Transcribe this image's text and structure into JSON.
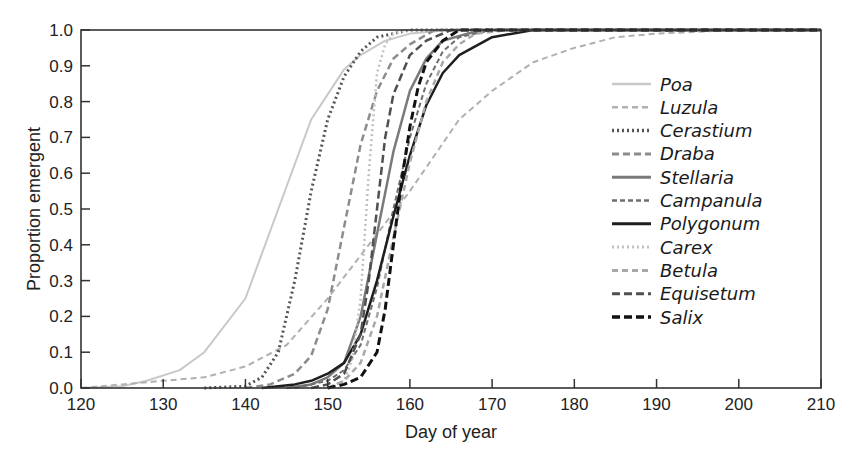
{
  "chart_data": {
    "type": "line",
    "title": "",
    "xlabel": "Day of year",
    "ylabel": "Proportion emergent",
    "xlim": [
      120,
      210
    ],
    "ylim": [
      0.0,
      1.0
    ],
    "x_ticks": [
      120,
      130,
      140,
      150,
      160,
      170,
      180,
      190,
      200,
      210
    ],
    "x_tick_labels": [
      "120",
      "130",
      "140",
      "150",
      "160",
      "170",
      "180",
      "190",
      "200",
      "210"
    ],
    "y_ticks": [
      0.0,
      0.1,
      0.2,
      0.3,
      0.4,
      0.5,
      0.6,
      0.7,
      0.8,
      0.9,
      1.0
    ],
    "y_tick_labels": [
      "0.0",
      "0.1",
      "0.2",
      "0.3",
      "0.4",
      "0.5",
      "0.6",
      "0.7",
      "0.8",
      "0.9",
      "1.0"
    ],
    "grid": false,
    "legend_position": "right, inside plot",
    "series": [
      {
        "name": "Poa",
        "color": "#c8c8c8",
        "dash": "solid",
        "width": 2,
        "x": [
          120,
          125,
          128,
          132,
          135,
          140,
          144,
          148,
          152,
          154,
          157,
          160,
          165,
          210
        ],
        "y": [
          0.0,
          0.005,
          0.02,
          0.05,
          0.1,
          0.25,
          0.5,
          0.75,
          0.89,
          0.93,
          0.97,
          0.99,
          1.0,
          1.0
        ]
      },
      {
        "name": "Luzula",
        "color": "#b0b0b0",
        "dash": "6,4",
        "width": 2,
        "x": [
          120,
          125,
          130,
          135,
          140,
          145,
          150,
          155,
          160,
          163,
          166,
          170,
          175,
          180,
          185,
          190,
          200,
          210
        ],
        "y": [
          0.0,
          0.01,
          0.02,
          0.03,
          0.06,
          0.12,
          0.25,
          0.4,
          0.55,
          0.65,
          0.75,
          0.83,
          0.91,
          0.95,
          0.98,
          0.99,
          1.0,
          1.0
        ]
      },
      {
        "name": "Cerastium",
        "color": "#555555",
        "dash": "2,3",
        "width": 3,
        "x": [
          135,
          140,
          142,
          144,
          146,
          148,
          150,
          152,
          154,
          156,
          160,
          210
        ],
        "y": [
          0.0,
          0.005,
          0.03,
          0.1,
          0.3,
          0.55,
          0.75,
          0.87,
          0.94,
          0.98,
          1.0,
          1.0
        ]
      },
      {
        "name": "Draba",
        "color": "#8c8c8c",
        "dash": "7,4",
        "width": 2.5,
        "x": [
          140,
          143,
          146,
          148,
          150,
          152,
          154,
          156,
          158,
          160,
          163,
          210
        ],
        "y": [
          0.0,
          0.01,
          0.04,
          0.09,
          0.22,
          0.45,
          0.68,
          0.83,
          0.92,
          0.96,
          1.0,
          1.0
        ]
      },
      {
        "name": "Stellaria",
        "color": "#7a7a7a",
        "dash": "solid",
        "width": 2.5,
        "x": [
          145,
          148,
          150,
          152,
          154,
          156,
          158,
          160,
          162,
          164,
          167,
          170,
          210
        ],
        "y": [
          0.0,
          0.01,
          0.03,
          0.07,
          0.2,
          0.43,
          0.66,
          0.83,
          0.92,
          0.97,
          0.99,
          1.0,
          1.0
        ]
      },
      {
        "name": "Campanula",
        "color": "#6e6e6e",
        "dash": "5,3",
        "width": 2,
        "x": [
          146,
          150,
          152,
          154,
          156,
          158,
          160,
          162,
          164,
          166,
          170,
          210
        ],
        "y": [
          0.0,
          0.02,
          0.05,
          0.12,
          0.28,
          0.5,
          0.7,
          0.85,
          0.94,
          0.98,
          1.0,
          1.0
        ]
      },
      {
        "name": "Polygonum",
        "color": "#1e1e1e",
        "dash": "solid",
        "width": 2.5,
        "x": [
          142,
          146,
          148,
          150,
          152,
          154,
          156,
          158,
          160,
          162,
          164,
          166,
          170,
          175,
          210
        ],
        "y": [
          0.0,
          0.01,
          0.02,
          0.04,
          0.07,
          0.15,
          0.3,
          0.48,
          0.65,
          0.79,
          0.88,
          0.93,
          0.98,
          1.0,
          1.0
        ]
      },
      {
        "name": "Carex",
        "color": "#c0c0c0",
        "dash": "2,3",
        "width": 2.5,
        "x": [
          150,
          152,
          153,
          154,
          155,
          156,
          157,
          158,
          160,
          210
        ],
        "y": [
          0.0,
          0.02,
          0.08,
          0.25,
          0.6,
          0.88,
          0.96,
          0.99,
          1.0,
          1.0
        ]
      },
      {
        "name": "Betula",
        "color": "#a8a8a8",
        "dash": "6,4",
        "width": 2.5,
        "x": [
          150,
          152,
          154,
          156,
          158,
          160,
          162,
          164,
          166,
          168,
          172,
          210
        ],
        "y": [
          0.0,
          0.02,
          0.07,
          0.2,
          0.42,
          0.63,
          0.8,
          0.91,
          0.96,
          0.99,
          1.0,
          1.0
        ]
      },
      {
        "name": "Equisetum",
        "color": "#505050",
        "dash": "8,4",
        "width": 2.5,
        "x": [
          148,
          150,
          152,
          154,
          155,
          156,
          157,
          158,
          160,
          162,
          165,
          210
        ],
        "y": [
          0.0,
          0.01,
          0.04,
          0.15,
          0.3,
          0.5,
          0.7,
          0.82,
          0.93,
          0.97,
          1.0,
          1.0
        ]
      },
      {
        "name": "Salix",
        "color": "#111111",
        "dash": "8,4",
        "width": 3,
        "x": [
          150,
          152,
          154,
          156,
          157,
          158,
          159,
          160,
          161,
          162,
          164,
          166,
          210
        ],
        "y": [
          0.0,
          0.01,
          0.03,
          0.1,
          0.22,
          0.4,
          0.58,
          0.73,
          0.84,
          0.91,
          0.97,
          1.0,
          1.0
        ]
      }
    ]
  },
  "legend": {
    "items": [
      "Poa",
      "Luzula",
      "Cerastium",
      "Draba",
      "Stellaria",
      "Campanula",
      "Polygonum",
      "Carex",
      "Betula",
      "Equisetum",
      "Salix"
    ]
  }
}
